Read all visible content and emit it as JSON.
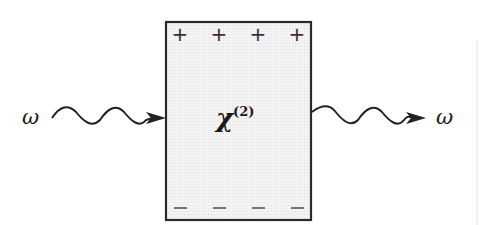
{
  "diagram": {
    "input_label": "ω",
    "output_label": "ω",
    "medium": {
      "symbol": "χ",
      "superscript": "(2)",
      "fill_color": "#f1f1f1",
      "border_color": "#2a2a2a"
    },
    "top_charges": [
      "+",
      "+",
      "+",
      "+"
    ],
    "bottom_charges": [
      "−",
      "−",
      "−",
      "−"
    ],
    "wave_color": "#222222"
  }
}
